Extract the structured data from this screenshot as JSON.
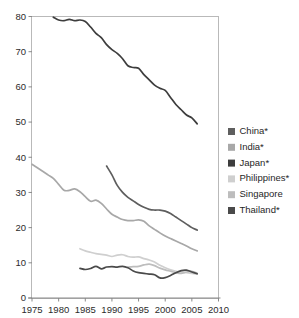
{
  "chart_data": {
    "type": "line",
    "title": "",
    "subtitle": "",
    "xlabel": "",
    "ylabel": "",
    "xlim": [
      1975,
      2010
    ],
    "ylim": [
      0,
      80
    ],
    "xticks": [
      1975,
      1980,
      1985,
      1990,
      1995,
      2000,
      2005,
      2010
    ],
    "yticks": [
      0,
      10,
      20,
      30,
      40,
      50,
      60,
      70,
      80
    ],
    "grid": false,
    "legend_position": "right",
    "series": [
      {
        "name": "China*",
        "color": "#5e5e5e",
        "x": [
          1989,
          1990,
          1991,
          1992,
          1993,
          1994,
          1995,
          1996,
          1997,
          1998,
          1999,
          2000,
          2001,
          2002,
          2003,
          2004,
          2005,
          2006
        ],
        "values": [
          37.5,
          35.0,
          32.0,
          30.0,
          28.6,
          27.6,
          26.6,
          25.8,
          25.2,
          25.0,
          25.0,
          24.7,
          24.0,
          23.0,
          22.0,
          21.0,
          20.0,
          19.3
        ]
      },
      {
        "name": "India*",
        "color": "#a8a8a8",
        "x": [
          1975,
          1976,
          1977,
          1978,
          1979,
          1980,
          1981,
          1982,
          1983,
          1984,
          1985,
          1986,
          1987,
          1988,
          1989,
          1990,
          1991,
          1992,
          1993,
          1994,
          1995,
          1996,
          1997,
          1998,
          1999,
          2000,
          2001,
          2002,
          2003,
          2004,
          2005,
          2006
        ],
        "values": [
          38.0,
          37.0,
          36.0,
          35.0,
          34.0,
          32.3,
          30.6,
          30.6,
          31.0,
          30.2,
          28.8,
          27.5,
          27.8,
          26.9,
          25.3,
          23.8,
          23.0,
          22.3,
          22.0,
          22.0,
          22.2,
          21.8,
          20.5,
          19.5,
          18.5,
          17.6,
          16.9,
          16.2,
          15.5,
          14.8,
          14.0,
          13.4
        ]
      },
      {
        "name": "Japan*",
        "color": "#3d3d3d",
        "x": [
          1979,
          1980,
          1981,
          1982,
          1983,
          1984,
          1985,
          1986,
          1987,
          1988,
          1989,
          1990,
          1991,
          1992,
          1993,
          1994,
          1995,
          1996,
          1997,
          1998,
          1999,
          2000,
          2001,
          2002,
          2003,
          2004,
          2005,
          2006
        ],
        "values": [
          79.8,
          79.0,
          78.8,
          79.2,
          78.8,
          79.0,
          78.6,
          77.0,
          75.2,
          74.0,
          72.0,
          70.6,
          69.5,
          68.0,
          66.0,
          65.5,
          65.3,
          63.5,
          62.0,
          60.5,
          59.6,
          59.0,
          57.0,
          55.0,
          53.5,
          52.0,
          51.2,
          49.5
        ]
      },
      {
        "name": "Philippines*",
        "color": "#cfcfcf",
        "x": [
          1984,
          1985,
          1986,
          1987,
          1988,
          1989,
          1990,
          1991,
          1992,
          1993,
          1994,
          1995,
          1996,
          1997,
          1998,
          1999,
          2000,
          2001,
          2002,
          2003,
          2004,
          2005,
          2006
        ],
        "values": [
          14.0,
          13.4,
          13.0,
          12.6,
          12.4,
          12.2,
          11.8,
          12.2,
          12.3,
          11.8,
          11.6,
          11.7,
          11.2,
          10.8,
          10.2,
          9.3,
          8.6,
          8.0,
          7.6,
          7.4,
          7.2,
          7.0,
          6.8
        ]
      },
      {
        "name": "Singapore",
        "color": "#bdbdbd",
        "x": [
          1993,
          1994,
          1995,
          1996,
          1997,
          1998,
          1999,
          2000,
          2001,
          2002,
          2003,
          2004,
          2005,
          2006
        ],
        "values": [
          8.8,
          8.9,
          9.0,
          9.4,
          9.6,
          9.2,
          8.5,
          8.0,
          7.6,
          7.2,
          7.0,
          7.4,
          7.6,
          7.0
        ]
      },
      {
        "name": "Thailand*",
        "color": "#4a4a4a",
        "x": [
          1984,
          1985,
          1986,
          1987,
          1988,
          1989,
          1990,
          1991,
          1992,
          1993,
          1994,
          1995,
          1996,
          1997,
          1998,
          1999,
          2000,
          2001,
          2002,
          2003,
          2004,
          2005,
          2006
        ],
        "values": [
          8.4,
          8.1,
          8.4,
          9.0,
          8.3,
          8.8,
          8.9,
          8.8,
          9.0,
          8.6,
          7.7,
          7.2,
          7.0,
          6.8,
          6.6,
          5.7,
          5.8,
          6.4,
          7.2,
          7.8,
          7.9,
          7.4,
          6.9
        ]
      }
    ]
  },
  "legend": {
    "items": [
      {
        "label": "China*",
        "color": "#5e5e5e"
      },
      {
        "label": "India*",
        "color": "#a8a8a8"
      },
      {
        "label": "Japan*",
        "color": "#3d3d3d"
      },
      {
        "label": "Philippines*",
        "color": "#cfcfcf"
      },
      {
        "label": "Singapore",
        "color": "#bdbdbd"
      },
      {
        "label": "Thailand*",
        "color": "#4a4a4a"
      }
    ]
  },
  "axes": {
    "x_tick_labels": [
      "1975",
      "1980",
      "1985",
      "1990",
      "1995",
      "2000",
      "2005",
      "2010"
    ],
    "y_tick_labels": [
      "0",
      "10",
      "20",
      "30",
      "40",
      "50",
      "60",
      "70",
      "80"
    ]
  }
}
